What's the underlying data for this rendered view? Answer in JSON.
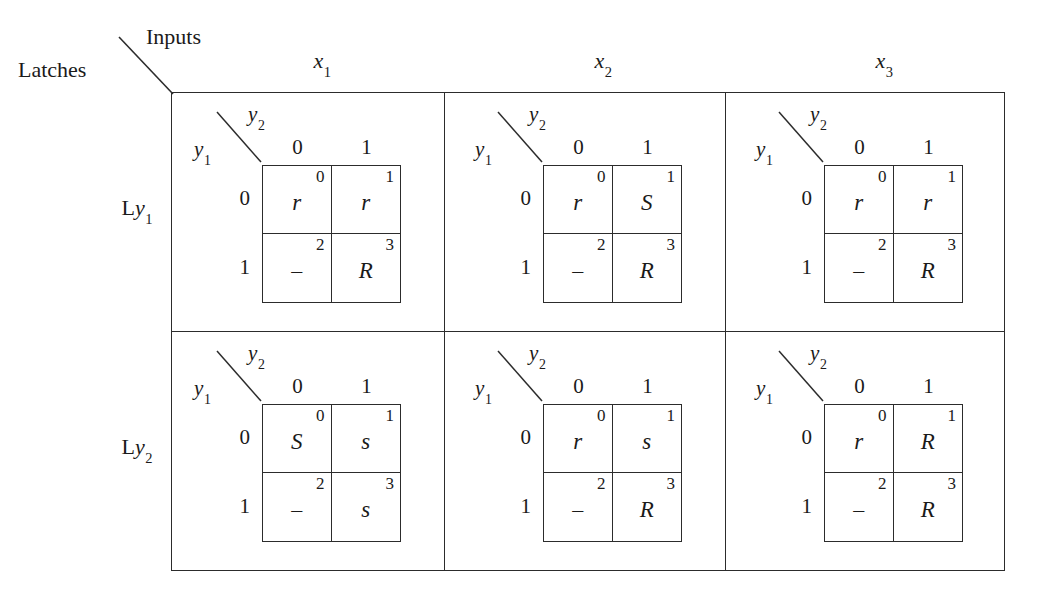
{
  "corner": {
    "inputs_label": "Inputs",
    "latches_label": "Latches"
  },
  "outer": {
    "column_headers": [
      {
        "name": "x",
        "sub": "1"
      },
      {
        "name": "x",
        "sub": "2"
      },
      {
        "name": "x",
        "sub": "3"
      }
    ],
    "row_labels": [
      {
        "prefix": "L",
        "name": "y",
        "sub": "1"
      },
      {
        "prefix": "L",
        "name": "y",
        "sub": "2"
      }
    ]
  },
  "kmap_common": {
    "y1_label": {
      "name": "y",
      "sub": "1"
    },
    "y2_label": {
      "name": "y",
      "sub": "2"
    },
    "col_labels": [
      "0",
      "1"
    ],
    "row_labels": [
      "0",
      "1"
    ],
    "cell_indices": [
      "0",
      "1",
      "2",
      "3"
    ]
  },
  "kmaps": [
    {
      "row": "Ly1",
      "col": "x1",
      "values": [
        "r",
        "r",
        "–",
        "R"
      ]
    },
    {
      "row": "Ly1",
      "col": "x2",
      "values": [
        "r",
        "S",
        "–",
        "R"
      ]
    },
    {
      "row": "Ly1",
      "col": "x3",
      "values": [
        "r",
        "r",
        "–",
        "R"
      ]
    },
    {
      "row": "Ly2",
      "col": "x1",
      "values": [
        "S",
        "s",
        "–",
        "s"
      ]
    },
    {
      "row": "Ly2",
      "col": "x2",
      "values": [
        "r",
        "s",
        "–",
        "R"
      ]
    },
    {
      "row": "Ly2",
      "col": "x3",
      "values": [
        "r",
        "R",
        "–",
        "R"
      ]
    }
  ],
  "colors": {
    "line": "#2c2c2c",
    "text": "#1a1a1a",
    "background": "#ffffff"
  }
}
